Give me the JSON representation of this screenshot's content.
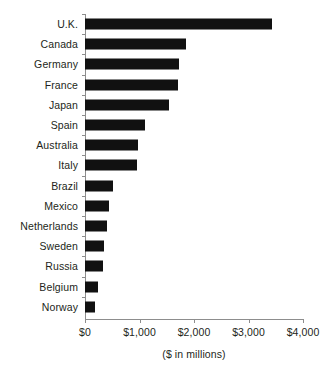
{
  "chart_data": {
    "type": "bar",
    "orientation": "horizontal",
    "title": "",
    "subtitle": "",
    "xlabel": "($ in millions)",
    "ylabel": "",
    "categories": [
      "U.K.",
      "Canada",
      "Germany",
      "France",
      "Japan",
      "Spain",
      "Australia",
      "Italy",
      "Brazil",
      "Mexico",
      "Netherlands",
      "Sweden",
      "Russia",
      "Belgium",
      "Norway"
    ],
    "values": [
      3430,
      1850,
      1720,
      1700,
      1540,
      1100,
      970,
      950,
      510,
      440,
      400,
      350,
      330,
      240,
      180
    ],
    "series": [
      {
        "name": "",
        "values": [
          3430,
          1850,
          1720,
          1700,
          1540,
          1100,
          970,
          950,
          510,
          440,
          400,
          350,
          330,
          240,
          180
        ]
      }
    ],
    "xlim": [
      0,
      4000
    ],
    "xticks": [
      0,
      1000,
      2000,
      3000,
      4000
    ],
    "xtick_labels": [
      "$0",
      "$1,000",
      "$2,000",
      "$3,000",
      "$4,000"
    ],
    "grid": false,
    "legend": false,
    "legend_position": "none",
    "bar_color": "#111111",
    "axis_color": "#8d8d8d",
    "text_color": "#231f20",
    "background": "#ffffff"
  },
  "axis": {
    "caption": "($ in millions)"
  }
}
